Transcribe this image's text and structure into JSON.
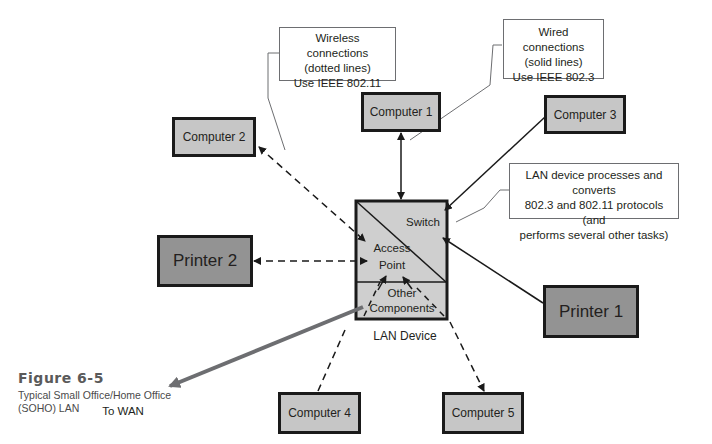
{
  "figure": {
    "number": "Figure 6-5",
    "caption": "Typical Small Office/Home Office (SOHO) LAN",
    "caption_line1": "Typical Small Office/Home Office",
    "caption_line2": "(SOHO) LAN"
  },
  "callouts": {
    "wireless": {
      "line1": "Wireless connections",
      "line2": "(dotted lines)",
      "line3": "Use IEEE 802.11"
    },
    "wired": {
      "line1": "Wired connections",
      "line2": "(solid lines)",
      "line3": "Use IEEE 802.3"
    },
    "lan_device": {
      "line1": "LAN device processes and converts",
      "line2": "802.3 and 802.11 protocols (and",
      "line3": "performs several other tasks)"
    }
  },
  "lan_device": {
    "label": "LAN Device",
    "sections": {
      "switch": "Switch",
      "access_point_line1": "Access",
      "access_point_line2": "Point",
      "other_line1": "Other",
      "other_line2": "Components"
    }
  },
  "nodes": {
    "computer1": "Computer 1",
    "computer2": "Computer 2",
    "computer3": "Computer 3",
    "computer4": "Computer 4",
    "computer5": "Computer 5",
    "printer1": "Printer 1",
    "printer2": "Printer 2"
  },
  "wan": {
    "label": "To WAN"
  },
  "connections": [
    {
      "from": "Computer 1",
      "to": "Switch",
      "type": "wired",
      "arrows": "both"
    },
    {
      "from": "Computer 3",
      "to": "Switch",
      "type": "wired",
      "arrows": "to-switch"
    },
    {
      "from": "Printer 1",
      "to": "Switch",
      "type": "wired",
      "arrows": "to-switch"
    },
    {
      "from": "Computer 2",
      "to": "Access Point",
      "type": "wireless",
      "arrows": "both"
    },
    {
      "from": "Printer 2",
      "to": "Access Point",
      "type": "wireless",
      "arrows": "both"
    },
    {
      "from": "Computer 4",
      "to": "Access Point",
      "type": "wireless",
      "arrows": "to-access-point"
    },
    {
      "from": "Computer 5",
      "to": "Access Point",
      "type": "wireless",
      "arrows": "both"
    },
    {
      "from": "Other Components",
      "to": "WAN",
      "type": "wan",
      "arrows": "to-wan"
    }
  ],
  "colors": {
    "computer_fill": "#c6c6c6",
    "printer_fill": "#939393",
    "lan_device_fill": "#cfcfcf",
    "wan_line": "#6d6e71",
    "border": "#1a1a1a"
  }
}
